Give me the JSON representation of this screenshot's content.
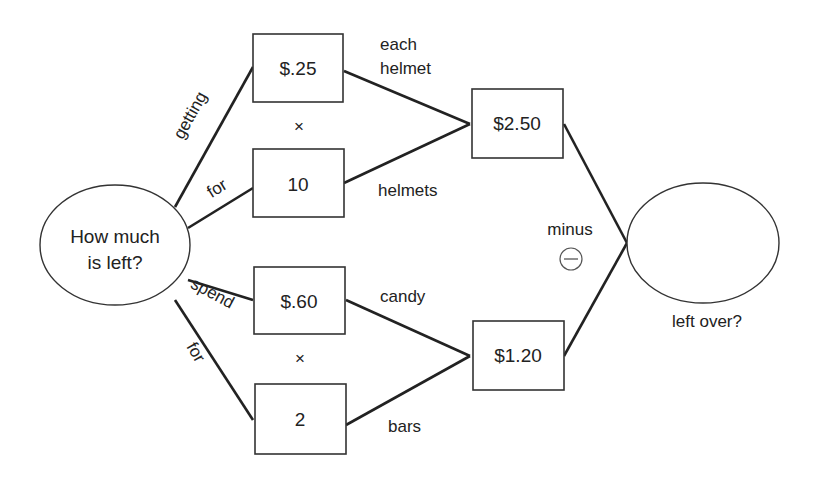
{
  "diagram": {
    "type": "problem-solving tree",
    "start_node": {
      "line1": "How much",
      "line2": "is left?"
    },
    "end_node": {
      "label": "left over?",
      "value": ""
    },
    "branches": {
      "top": {
        "label1": "getting",
        "label2": "for",
        "box1": "$.25",
        "box2": "10",
        "operator": "×",
        "box1_label": {
          "line1": "each",
          "line2": "helmet"
        },
        "box2_label": "helmets",
        "result": "$2.50"
      },
      "bottom": {
        "label1": "spend",
        "label2": "for",
        "box1": "$.60",
        "box2": "2",
        "operator": "×",
        "box1_label": "candy",
        "box2_label": "bars",
        "result": "$1.20"
      }
    },
    "combine": {
      "label": "minus",
      "symbol": "−"
    }
  },
  "colors": {
    "stroke": "#222222",
    "background": "#ffffff"
  }
}
